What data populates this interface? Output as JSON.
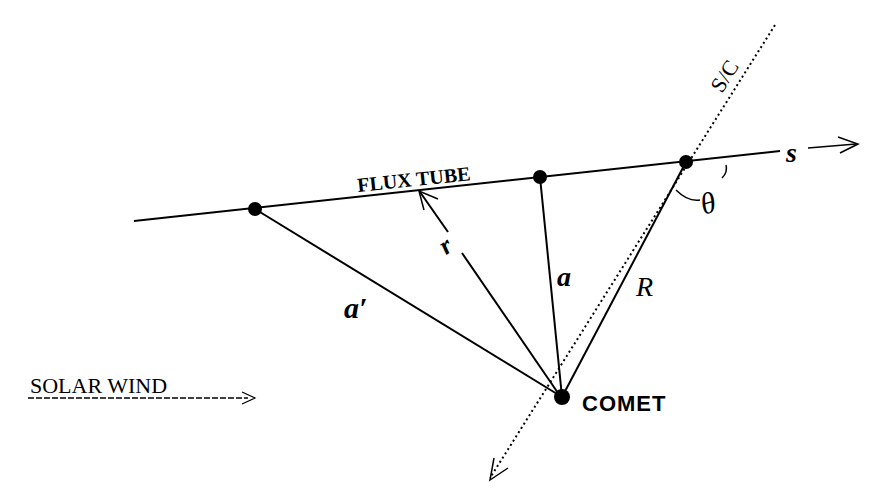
{
  "labels": {
    "flux_tube": "FLUX TUBE",
    "s_axis": "s",
    "sc": "S/C",
    "theta": "θ",
    "r": "r",
    "a": "a",
    "a_prime": "a′",
    "R": "R",
    "comet": "COMET",
    "solar_wind": "SOLAR WIND"
  },
  "colors": {
    "ink": "#000000",
    "background": "#ffffff"
  }
}
